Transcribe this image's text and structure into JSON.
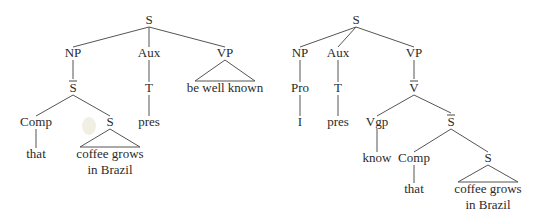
{
  "trees": [
    {
      "id": "tree-left",
      "nodes": [
        {
          "id": "S",
          "label": "S",
          "x": 149,
          "y": 24
        },
        {
          "id": "NP",
          "label": "NP",
          "x": 73,
          "y": 57
        },
        {
          "id": "Aux",
          "label": "Aux",
          "x": 149,
          "y": 57
        },
        {
          "id": "VP",
          "label": "VP",
          "x": 225,
          "y": 57
        },
        {
          "id": "Sbar",
          "label": "S",
          "bar": true,
          "x": 73,
          "y": 92
        },
        {
          "id": "T",
          "label": "T",
          "x": 149,
          "y": 92
        },
        {
          "id": "Comp",
          "label": "Comp",
          "x": 36,
          "y": 126
        },
        {
          "id": "S2",
          "label": "S",
          "x": 110,
          "y": 126
        },
        {
          "id": "pres",
          "label": "pres",
          "x": 149,
          "y": 126
        },
        {
          "id": "that",
          "label": "that",
          "x": 36,
          "y": 158
        },
        {
          "id": "coffee1",
          "label": "coffee grows",
          "x": 110,
          "y": 158
        },
        {
          "id": "brazil1",
          "label": "in Brazil",
          "x": 110,
          "y": 174
        },
        {
          "id": "bwk",
          "label": "be well known",
          "x": 225,
          "y": 92
        }
      ],
      "edges": [
        [
          "S",
          "NP"
        ],
        [
          "S",
          "Aux"
        ],
        [
          "S",
          "VP"
        ],
        [
          "NP",
          "Sbar"
        ],
        [
          "Aux",
          "T"
        ],
        [
          "T",
          "pres"
        ],
        [
          "Sbar",
          "Comp"
        ],
        [
          "Sbar",
          "S2"
        ],
        [
          "Comp",
          "that"
        ]
      ],
      "triangles": [
        {
          "parent": "VP",
          "child": "bwk",
          "width": 60
        },
        {
          "parent": "S2",
          "child": "coffee1",
          "width": 60
        }
      ]
    },
    {
      "id": "tree-right",
      "nodes": [
        {
          "id": "S",
          "label": "S",
          "x": 356,
          "y": 24
        },
        {
          "id": "NP",
          "label": "NP",
          "x": 300,
          "y": 57
        },
        {
          "id": "Aux",
          "label": "Aux",
          "x": 338,
          "y": 57
        },
        {
          "id": "VP",
          "label": "VP",
          "x": 414,
          "y": 57
        },
        {
          "id": "Pro",
          "label": "Pro",
          "x": 300,
          "y": 92
        },
        {
          "id": "T",
          "label": "T",
          "x": 338,
          "y": 92
        },
        {
          "id": "Vbar",
          "label": "V",
          "bar": true,
          "x": 414,
          "y": 92
        },
        {
          "id": "I",
          "label": "I",
          "x": 300,
          "y": 126
        },
        {
          "id": "pres",
          "label": "pres",
          "x": 338,
          "y": 126
        },
        {
          "id": "Vgp",
          "label": "Vgp",
          "x": 377,
          "y": 126
        },
        {
          "id": "Sbar",
          "label": "S",
          "bar": true,
          "x": 451,
          "y": 126
        },
        {
          "id": "know",
          "label": "know",
          "x": 377,
          "y": 162
        },
        {
          "id": "Comp",
          "label": "Comp",
          "x": 414,
          "y": 162
        },
        {
          "id": "S2",
          "label": "S",
          "x": 488,
          "y": 162
        },
        {
          "id": "that",
          "label": "that",
          "x": 414,
          "y": 193
        },
        {
          "id": "coffee2",
          "label": "coffee grows",
          "x": 488,
          "y": 193
        },
        {
          "id": "brazil2",
          "label": "in Brazil",
          "x": 488,
          "y": 209
        }
      ],
      "edges": [
        [
          "S",
          "NP"
        ],
        [
          "S",
          "Aux"
        ],
        [
          "S",
          "VP"
        ],
        [
          "NP",
          "Pro"
        ],
        [
          "Pro",
          "I"
        ],
        [
          "Aux",
          "T"
        ],
        [
          "T",
          "pres"
        ],
        [
          "VP",
          "Vbar"
        ],
        [
          "Vbar",
          "Vgp"
        ],
        [
          "Vbar",
          "Sbar"
        ],
        [
          "Vgp",
          "know"
        ],
        [
          "Sbar",
          "Comp"
        ],
        [
          "Sbar",
          "S2"
        ],
        [
          "Comp",
          "that"
        ]
      ],
      "triangles": [
        {
          "parent": "S2",
          "child": "coffee2",
          "width": 60
        }
      ]
    }
  ]
}
